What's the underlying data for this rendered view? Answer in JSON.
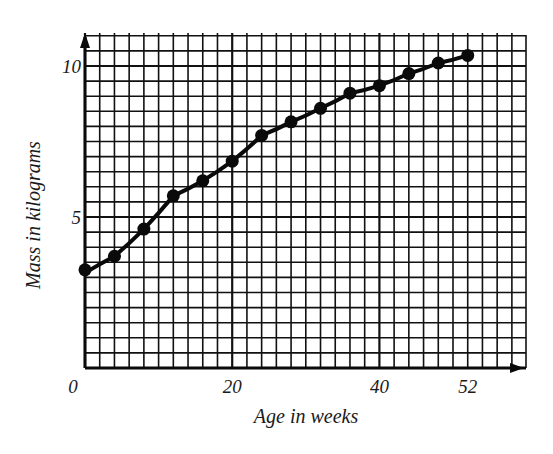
{
  "chart_data": {
    "type": "line",
    "title": "",
    "xlabel": "Age in weeks",
    "ylabel": "Mass in kilograms",
    "x_tick_labels": [
      "0",
      "20",
      "40",
      "52"
    ],
    "x_ticks": [
      0,
      20,
      40,
      52
    ],
    "y_tick_labels": [
      "5",
      "10"
    ],
    "y_ticks": [
      5,
      10
    ],
    "xlim": [
      0,
      60
    ],
    "ylim": [
      0,
      11.1
    ],
    "grid": true,
    "grid_x_step": 2,
    "grid_y_step": 0.5,
    "legend": null,
    "series": [
      {
        "name": "Mass",
        "x": [
          0,
          4,
          8,
          12,
          16,
          20,
          24,
          28,
          32,
          36,
          40,
          44,
          48,
          52
        ],
        "values": [
          3.25,
          3.7,
          4.6,
          5.7,
          6.2,
          6.85,
          7.7,
          8.15,
          8.6,
          9.1,
          9.35,
          9.75,
          10.1,
          10.35
        ]
      }
    ]
  },
  "layout": {
    "plot_left": 85,
    "plot_right": 526,
    "plot_bottom": 368,
    "plot_top": 33,
    "px_per_week": 7.36,
    "px_per_kg": 30.2
  },
  "colors": {
    "ink": "#0a0a0a",
    "background": "#ffffff"
  }
}
